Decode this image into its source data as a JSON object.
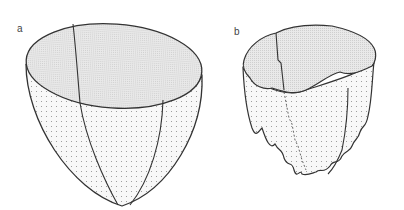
{
  "figure": {
    "panels": [
      {
        "label": "a",
        "description": "Smooth ellipsoidal bowl with shaded elliptical top surface and dotted exterior, three meridian lines"
      },
      {
        "label": "b",
        "description": "Irregular bowl with wavy rim and fringed, dripping lower edges; shaded top and dotted exterior"
      }
    ]
  },
  "colors": {
    "stroke": "#333333",
    "top_fill": "#e4e4e4",
    "side_fill": "#f7f7f7",
    "dot": "#9a9a9a",
    "background": "#ffffff"
  }
}
